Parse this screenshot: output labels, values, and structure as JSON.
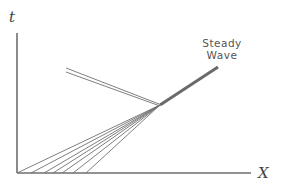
{
  "diagram": {
    "axes": {
      "y_label": "t",
      "x_label": "X",
      "origin": [
        17,
        173
      ],
      "y_top": 33,
      "x_right": 251
    },
    "annotation": {
      "line1": "Steady",
      "line2": "Wave"
    },
    "convergence_point": [
      160,
      105
    ],
    "steady_wave_end": [
      218,
      67
    ],
    "fan_origins_x": [
      17,
      31,
      44,
      53,
      62,
      73,
      86
    ],
    "reflected_pair": [
      {
        "from": [
          66,
          68
        ],
        "to": [
          159,
          104
        ]
      },
      {
        "from": [
          66,
          72
        ],
        "to": [
          160,
          106
        ]
      }
    ],
    "colors": {
      "line": "#6e6e6e",
      "text": "#555555"
    }
  }
}
